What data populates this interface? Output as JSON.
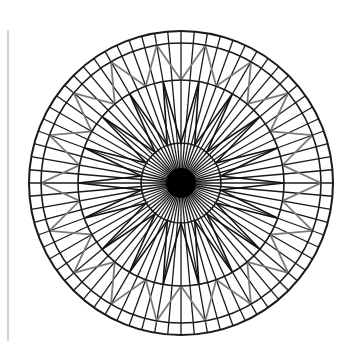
{
  "figure": {
    "center": [
      181,
      183
    ],
    "rings": [
      {
        "name": "outer-ring",
        "radius": 152
      },
      {
        "name": "band-ring",
        "radius": 140
      },
      {
        "name": "middle-ring",
        "radius": 103
      },
      {
        "name": "inner-ring",
        "radius": 40
      }
    ],
    "center_disk_radius": 15,
    "spokes": {
      "count": 72,
      "inner_radius": 0,
      "outer_radius": 152
    },
    "outer_zigzag": {
      "points": 18,
      "valley_radius": 103,
      "peak_radius": 140,
      "color": "#7a7a7a"
    },
    "inner_zigzag": {
      "points": 18,
      "valley_radius": 40,
      "peak_radius": 103,
      "color": "#111111"
    },
    "stroke_color": "#1a1a1a",
    "side_rule_color": "#d4d4d4"
  }
}
